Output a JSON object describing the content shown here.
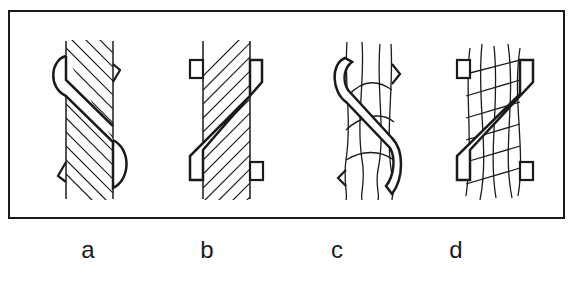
{
  "diagram": {
    "type": "rope-wrap-illustration",
    "frame": {
      "border_color": "#1a1a1a"
    },
    "figures": [
      {
        "id": "a",
        "label": "a",
        "rope": "wire rope (hatched strands, right-down lay)",
        "wrap": "rounded S-shaped band",
        "clips": "angled tabs"
      },
      {
        "id": "b",
        "label": "b",
        "rope": "wire rope (hatched strands, left-down lay)",
        "wrap": "angular Z-shaped band",
        "clips": "square tabs"
      },
      {
        "id": "c",
        "label": "c",
        "rope": "fibre rope (twisted strands)",
        "wrap": "rounded S-shaped band",
        "clips": "angled tabs"
      },
      {
        "id": "d",
        "label": "d",
        "rope": "fibre rope (braided strands)",
        "wrap": "angular Z-shaped band",
        "clips": "square tabs"
      }
    ]
  }
}
